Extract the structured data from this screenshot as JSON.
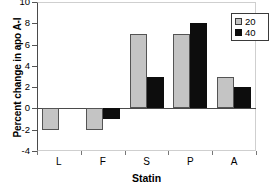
{
  "chart_data": {
    "type": "bar",
    "title": "",
    "xlabel": "Statin",
    "ylabel": "Percent change in apo A-I",
    "categories": [
      "L",
      "F",
      "S",
      "P",
      "A"
    ],
    "series": [
      {
        "name": "20",
        "color": "#c4c4c4",
        "values": [
          -2,
          -2,
          7,
          7,
          3
        ]
      },
      {
        "name": "40",
        "color": "#0d0d0d",
        "values": [
          null,
          -1,
          3,
          8,
          2
        ]
      }
    ],
    "ylim": [
      -4,
      10
    ],
    "yticks": [
      10,
      8,
      6,
      4,
      2,
      0,
      -2,
      -4
    ],
    "ytick_labels": [
      "10",
      "8",
      "6",
      "4",
      "2",
      "0",
      "-2",
      "-4"
    ],
    "grid": false,
    "legend_position": "top-right",
    "legend_entries": [
      "20",
      "40"
    ]
  }
}
